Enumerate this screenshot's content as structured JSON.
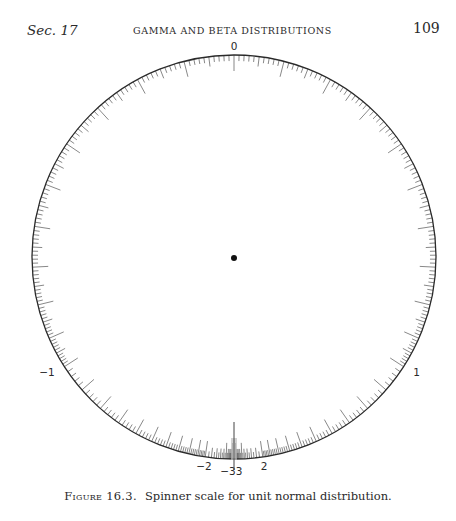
{
  "running_head": {
    "section": "Sec. 17",
    "title": "GAMMA AND BETA DISTRIBUTIONS",
    "page_number": "109"
  },
  "figure": {
    "label": "Figure 16.3.",
    "caption": "Spinner scale for unit normal distribution."
  },
  "chart_data": {
    "type": "dial",
    "title": "Spinner scale for unit normal distribution",
    "center": [
      234,
      257
    ],
    "radius": 202,
    "labels": [
      {
        "text": "0",
        "z": 0
      },
      {
        "text": "1",
        "z": 1
      },
      {
        "text": "-1",
        "z": -1
      },
      {
        "text": "2",
        "z": 2
      },
      {
        "text": "-2",
        "z": -2
      },
      {
        "text": "3",
        "z": 3
      },
      {
        "text": "-3",
        "z": -3
      }
    ],
    "tick_segments": [
      {
        "from": 0.0,
        "to": 1.0,
        "step": 0.01,
        "major_every": 0.1,
        "mid_every": 0.05
      },
      {
        "from": 1.0,
        "to": 2.0,
        "step": 0.02,
        "major_every": 0.1,
        "mid_every": 0.1
      },
      {
        "from": 2.0,
        "to": 3.0,
        "step": 0.05,
        "major_every": 0.5,
        "mid_every": 0.1
      }
    ],
    "pointer": {
      "description": "vertical index line at bottom",
      "x": 234,
      "y_top": 422,
      "y_bottom": 460
    },
    "center_dot": {
      "x": 234,
      "y": 258,
      "r": 3
    }
  },
  "colors": {
    "ink": "#2a2a2a",
    "tick": "#555555",
    "band": "#bdbdbd"
  }
}
